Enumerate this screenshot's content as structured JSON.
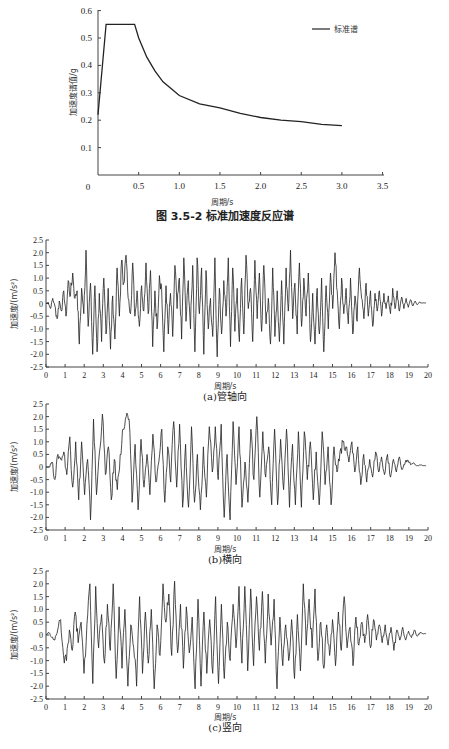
{
  "chart_data": [
    {
      "type": "line",
      "title": "图 3.5-2   标准加速度反应谱",
      "xlabel": "周期/s",
      "ylabel": "加速度谱值/g",
      "xlim": [
        0,
        3.5
      ],
      "ylim": [
        0,
        0.6
      ],
      "xticks": [
        "0",
        "0.5",
        "1.0",
        "1.5",
        "2.0",
        "2.5",
        "3.0",
        "3.5"
      ],
      "yticks": [
        "0.1",
        "0.2",
        "0.3",
        "0.4",
        "0.5",
        "0.6"
      ],
      "grid": false,
      "legend": {
        "position": "upper right",
        "entries": [
          "标准谱"
        ]
      },
      "series": [
        {
          "name": "标准谱",
          "x": [
            0,
            0.1,
            0.45,
            0.5,
            0.6,
            0.7,
            0.8,
            1.0,
            1.25,
            1.5,
            1.75,
            2.0,
            2.25,
            2.5,
            2.75,
            3.0
          ],
          "y": [
            0.22,
            0.55,
            0.55,
            0.5,
            0.43,
            0.38,
            0.34,
            0.29,
            0.26,
            0.245,
            0.225,
            0.21,
            0.2,
            0.195,
            0.185,
            0.18
          ]
        }
      ]
    },
    {
      "type": "line",
      "title": "(a)管轴向",
      "xlabel": "周期/s",
      "ylabel": "加速度/(m/s²)",
      "xlim": [
        0,
        20
      ],
      "ylim": [
        -2.5,
        2.5
      ],
      "xticks": [
        "0",
        "1",
        "2",
        "3",
        "4",
        "5",
        "6",
        "7",
        "8",
        "9",
        "10",
        "11",
        "12",
        "13",
        "14",
        "15",
        "16",
        "17",
        "18",
        "19",
        "20"
      ],
      "yticks": [
        "2.5",
        "2.0",
        "1.5",
        "1.0",
        "0.5",
        "0",
        "-0.5",
        "-1.0",
        "-1.5",
        "-2.0",
        "-2.5"
      ],
      "grid": false,
      "series": [
        {
          "name": "管轴向",
          "x_step": 0.1,
          "values": [
            0,
            0.05,
            -0.2,
            0.2,
            -0.1,
            -0.6,
            0.1,
            -0.3,
            0.5,
            -0.5,
            0.9,
            0.3,
            1.2,
            0.2,
            0.5,
            -1.6,
            0.6,
            -0.4,
            2.1,
            -0.9,
            0.8,
            -2.0,
            0.7,
            -1.9,
            0.4,
            -1.5,
            1.0,
            -1.2,
            0.6,
            -1.8,
            0.3,
            -1.4,
            1.4,
            -0.5,
            1.7,
            0.8,
            1.9,
            0.2,
            -0.4,
            1.6,
            -0.5,
            0.5,
            -0.9,
            0.7,
            -0.3,
            1.6,
            -0.4,
            1.3,
            -1.7,
            0.5,
            -1.0,
            1.1,
            0.6,
            -1.9,
            0.7,
            -1.2,
            0.4,
            -1.3,
            1.5,
            -0.2,
            1.0,
            -1.4,
            1.8,
            -0.7,
            0.9,
            -1.0,
            1.5,
            -1.9,
            1.8,
            -0.4,
            1.4,
            -2.0,
            1.3,
            -1.0,
            0.2,
            -1.3,
            1.8,
            -2.1,
            0.6,
            -1.2,
            0.9,
            -0.5,
            1.8,
            -1.7,
            1.4,
            -1.1,
            0.6,
            -1.5,
            1.0,
            -1.2,
            1.9,
            -0.2,
            0.6,
            -1.5,
            1.7,
            -0.6,
            1.2,
            -1.1,
            1.5,
            -0.8,
            0.2,
            -1.6,
            1.4,
            -1.3,
            0.5,
            -1.5,
            0.9,
            -1.6,
            1.4,
            -0.3,
            2.1,
            -0.6,
            0.8,
            -1.2,
            1.6,
            -0.9,
            1.0,
            -0.5,
            1.2,
            -1.5,
            0.4,
            -1.6,
            0.6,
            -1.2,
            1.0,
            -1.9,
            0.7,
            -1.0,
            1.2,
            -0.2,
            2.0,
            0.5,
            -1.0,
            1.0,
            -0.4,
            0.6,
            -0.8,
            1.0,
            -1.2,
            0.3,
            -0.7,
            1.4,
            0.2,
            -0.6,
            0.8,
            -0.5,
            0.5,
            -0.9,
            0.4,
            -0.3,
            0.5,
            -0.5,
            0.4,
            -0.2,
            0.3,
            -0.4,
            0.6,
            -0.2,
            0.5,
            -0.3,
            0.25,
            -0.2,
            0.2,
            -0.15,
            0.15,
            -0.1,
            0.1,
            -0.05,
            0.05,
            0.02,
            0.02,
            0.02,
            0,
            0,
            0,
            0,
            0,
            0,
            0,
            0,
            0,
            0,
            0,
            0,
            0,
            0,
            0,
            0,
            0,
            0,
            0,
            0,
            0,
            0,
            0,
            0,
            0
          ]
        }
      ]
    },
    {
      "type": "line",
      "title": "(b)横向",
      "xlabel": "周期/s",
      "ylabel": "加速度/(m/s²)",
      "xlim": [
        0,
        20
      ],
      "ylim": [
        -2.5,
        2.5
      ],
      "xticks": [
        "0",
        "1",
        "2",
        "3",
        "4",
        "5",
        "6",
        "7",
        "8",
        "9",
        "10",
        "11",
        "12",
        "13",
        "14",
        "15",
        "16",
        "17",
        "18",
        "19",
        "20"
      ],
      "yticks": [
        "2.5",
        "2.0",
        "1.5",
        "1.0",
        "0.5",
        "0",
        "-0.5",
        "-1.0",
        "-1.5",
        "-2.0",
        "-2.5"
      ],
      "grid": false,
      "series": [
        {
          "name": "横向",
          "x_step": 0.1,
          "values": [
            0,
            0,
            0.2,
            -0.5,
            0.5,
            0.3,
            0.6,
            -0.3,
            1.2,
            -0.8,
            1.0,
            -1.3,
            1.0,
            -1.1,
            0.3,
            -2.1,
            1.9,
            -1.1,
            0.6,
            2.1,
            -0.3,
            0.8,
            -1.3,
            0.3,
            -0.9,
            0.5,
            1.5,
            2.0,
            1.9,
            -1.4,
            0.9,
            -1.7,
            1.1,
            -0.8,
            0.5,
            -1.1,
            1.3,
            -0.6,
            0.2,
            1.5,
            -1.4,
            0.8,
            -0.6,
            1.8,
            -0.8,
            1.7,
            -1.6,
            0.9,
            -1.6,
            1.6,
            -1.4,
            0.5,
            -1.7,
            0.8,
            -1.2,
            1.6,
            -0.2,
            1.6,
            -0.5,
            1.7,
            -2.0,
            0.5,
            -2.1,
            1.8,
            -0.7,
            1.6,
            -1.6,
            0.2,
            -1.4,
            1.5,
            -0.5,
            2.0,
            -1.2,
            1.4,
            -0.4,
            0.8,
            -1.5,
            1.5,
            -1.5,
            1.1,
            -0.9,
            1.5,
            -1.6,
            0.9,
            -1.5,
            1.4,
            -1.6,
            1.4,
            -0.5,
            1.0,
            -1.3,
            0.6,
            -1.5,
            1.4,
            -0.7,
            0.8,
            -1.5,
            0.8,
            -0.2,
            0.6,
            1.0,
            0.8,
            0.2,
            1.0,
            -0.2,
            0.8,
            -0.7,
            0.5,
            -0.6,
            0.3,
            -0.4,
            0.6,
            -0.2,
            0.4,
            -0.3,
            0.5,
            -0.4,
            0.3,
            -0.2,
            0.4,
            -0.1,
            0.2,
            0.25,
            0.1,
            0.15,
            0.05,
            0.08,
            0.05,
            0.05,
            0,
            0,
            0,
            0,
            0,
            0,
            0,
            0,
            0,
            0,
            0,
            0,
            0,
            0,
            0,
            0,
            0,
            0,
            0,
            0,
            0,
            0,
            0,
            0,
            0,
            0,
            0,
            0,
            0,
            0,
            0,
            0,
            0,
            0,
            0,
            0,
            0,
            0,
            0,
            0,
            0,
            0,
            0,
            0,
            0,
            0,
            0,
            0,
            0,
            0,
            0,
            0,
            0,
            0,
            0,
            0,
            0,
            0,
            0,
            0,
            0,
            0,
            0,
            0,
            0,
            0,
            0,
            0,
            0,
            0,
            0,
            0,
            0,
            0,
            0,
            0,
            0
          ]
        }
      ]
    },
    {
      "type": "line",
      "title": "(c)竖向",
      "xlabel": "周期/s",
      "ylabel": "加速度/(m/s²)",
      "xlim": [
        0,
        20
      ],
      "ylim": [
        -2.5,
        2.5
      ],
      "xticks": [
        "0",
        "1",
        "2",
        "3",
        "4",
        "5",
        "6",
        "7",
        "8",
        "9",
        "10",
        "11",
        "12",
        "13",
        "14",
        "15",
        "16",
        "17",
        "18",
        "19",
        "20"
      ],
      "yticks": [
        "2.5",
        "2.0",
        "1.5",
        "1.0",
        "0.5",
        "0",
        "-0.5",
        "-1.0",
        "-1.5",
        "-2.0",
        "-2.5"
      ],
      "grid": false,
      "series": [
        {
          "name": "竖向",
          "x_step": 0.1,
          "values": [
            0,
            0.1,
            -0.1,
            -0.2,
            0.2,
            0.6,
            -0.8,
            -1.0,
            0.2,
            -0.6,
            0.9,
            -0.3,
            0.5,
            -1.5,
            0.4,
            2.0,
            -1.9,
            1.9,
            -0.5,
            0.8,
            -1.1,
            1.2,
            -0.6,
            2.0,
            -1.7,
            1.1,
            -1.3,
            1.0,
            -2.0,
            0.4,
            -0.5,
            -2.0,
            1.5,
            -1.5,
            0.9,
            -1.1,
            1.0,
            -2.1,
            0.4,
            -0.8,
            2.0,
            0.5,
            1.6,
            -0.8,
            2.1,
            -0.7,
            1.2,
            -1.3,
            1.1,
            -0.7,
            0.7,
            -2.1,
            1.4,
            -2.0,
            0.9,
            -1.5,
            0.6,
            -1.5,
            1.5,
            -1.9,
            1.2,
            -1.7,
            0.5,
            -1.0,
            1.2,
            -0.5,
            1.9,
            -1.1,
            1.9,
            -1.4,
            1.8,
            -1.2,
            1.5,
            -0.6,
            1.7,
            -1.1,
            1.6,
            -0.4,
            1.4,
            -2.1,
            0.7,
            -1.2,
            0.4,
            -1.0,
            0.6,
            -1.7,
            0.8,
            -1.4,
            2.0,
            -0.4,
            1.4,
            -0.5,
            1.8,
            -1.0,
            0.5,
            -1.3,
            0.4,
            -0.8,
            0.6,
            -1.2,
            0.9,
            -0.6,
            1.5,
            -0.5,
            0.3,
            -1.2,
            0.7,
            -0.4,
            0.5,
            -0.3,
            0.8,
            -0.5,
            0.6,
            -0.2,
            0.4,
            -0.3,
            0.4,
            -0.4,
            0.3,
            -0.6,
            0.2,
            -0.2,
            0.3,
            -0.2,
            0.15,
            -0.1,
            0.2,
            -0.05,
            0.1,
            0.05,
            0.05,
            0,
            0,
            0,
            0,
            0,
            0,
            0,
            0,
            0,
            0,
            0,
            0,
            0,
            0,
            0,
            0,
            0,
            0,
            0,
            0,
            0,
            0,
            0,
            0,
            0,
            0,
            0,
            0,
            0,
            0,
            0,
            0,
            0,
            0,
            0,
            0,
            0,
            0,
            0,
            0,
            0,
            0,
            0,
            0,
            0,
            0,
            0,
            0,
            0,
            0,
            0,
            0,
            0,
            0,
            0,
            0,
            0,
            0,
            0,
            0,
            0,
            0,
            0,
            0,
            0,
            0,
            0,
            0,
            0,
            0,
            0,
            0,
            0,
            0,
            0,
            0,
            0,
            0,
            0,
            0
          ]
        }
      ]
    }
  ],
  "figure": {
    "spectrum_caption": "图 3.5-2   标准加速度反应谱",
    "spectrum_xlabel": "周期/s",
    "spectrum_ylabel": "加速度谱值/g",
    "spectrum_legend": "标准谱",
    "history_xlabel": "周期/s",
    "history_ylabel": "加速度/(m/s²)",
    "sub_a": "(a)管轴向",
    "sub_b": "(b)横向",
    "sub_c": "(c)竖向",
    "origin_label": "0"
  }
}
